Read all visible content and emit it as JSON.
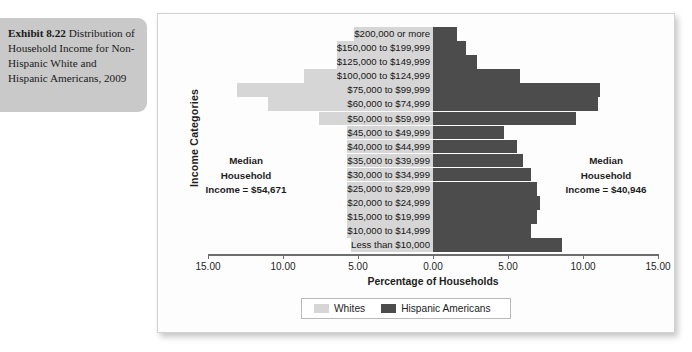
{
  "caption": {
    "exhibit_number": "Exhibit 8.22",
    "text": " Distribution of Household Income for Non-Hispanic White and Hispanic Americans, 2009"
  },
  "chart_data": {
    "type": "bar",
    "orientation": "horizontal-diverging",
    "title": "Distribution of Household Income for Non-Hispanic White and Hispanic Americans, 2009",
    "xlabel": "Percentage of Households",
    "ylabel": "Income Categories",
    "xlim": [
      -15,
      15
    ],
    "xticks": [
      -15,
      -10,
      -5,
      0,
      5,
      10,
      15
    ],
    "xticklabels": [
      "15.00",
      "10.00",
      "5.00",
      "0.00",
      "5.00",
      "10.00",
      "15.00"
    ],
    "grid": false,
    "legend_position": "bottom",
    "categories": [
      "$200,000 or more",
      "$150,000 to $199,999",
      "$125,000 to $149,999",
      "$100,000 to $124,999",
      "$75,000 to $99,999",
      "$60,000 to $74,999",
      "$50,000 to $59,999",
      "$45,000 to $49,999",
      "$40,000 to $44,999",
      "$35,000 to $39,999",
      "$30,000 to $34,999",
      "$25,000 to $29,999",
      "$20,000 to $24,999",
      "$15,000 to $19,999",
      "$10,000 to $14,999",
      "Less than $10,000"
    ],
    "series": [
      {
        "name": "Whites",
        "color": "#d6d6d6",
        "side": "left",
        "values": [
          3.2,
          4.0,
          4.6,
          8.6,
          13.1,
          11.0,
          7.6,
          3.6,
          4.0,
          4.2,
          5.0,
          5.1,
          5.2,
          4.7,
          4.5,
          5.4
        ]
      },
      {
        "name": "Hispanic Americans",
        "color": "#4c4c4c",
        "side": "right",
        "values": [
          1.6,
          2.2,
          2.9,
          5.8,
          11.1,
          11.0,
          9.5,
          4.7,
          5.6,
          6.0,
          6.5,
          6.9,
          7.1,
          6.9,
          6.5,
          8.6
        ]
      }
    ],
    "annotations": [
      {
        "id": "median-whites",
        "side": "left",
        "lines": [
          "Median",
          "Household",
          "Income = $54,671"
        ],
        "value": "$54,671"
      },
      {
        "id": "median-hispanic",
        "side": "right",
        "lines": [
          "Median",
          "Household",
          "Income = $40,946"
        ],
        "value": "$40,946"
      }
    ]
  },
  "legend": {
    "whites_label": "Whites",
    "hispanic_label": "Hispanic Americans"
  },
  "medians": {
    "left_line1": "Median",
    "left_line2": "Household",
    "left_line3": "Income = $54,671",
    "right_line1": "Median",
    "right_line2": "Household",
    "right_line3": "Income = $40,946"
  },
  "colors": {
    "whites": "#d6d6d6",
    "hispanic": "#4c4c4c",
    "caption_bg": "#c9c9c9",
    "axis": "#6d6d6d"
  }
}
